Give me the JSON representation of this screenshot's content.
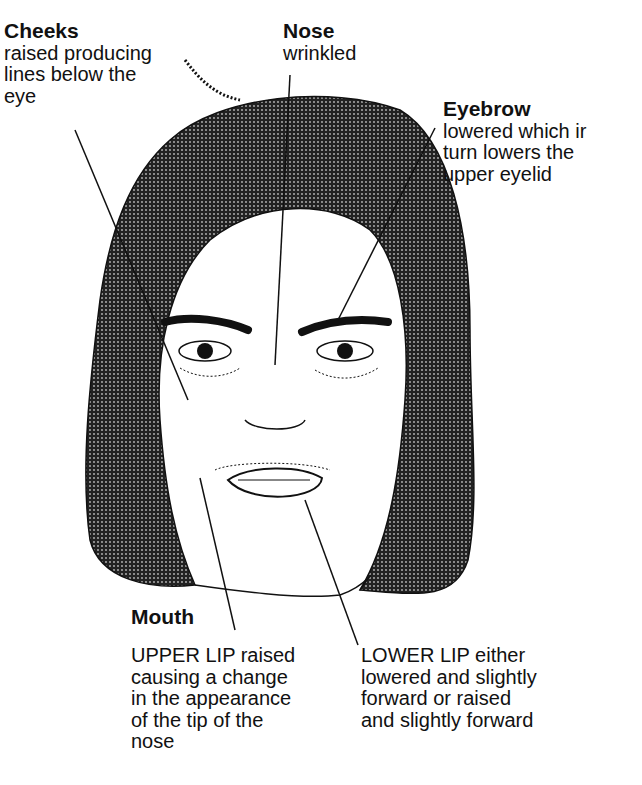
{
  "labels": {
    "cheeks": {
      "title": "Cheeks",
      "lines": [
        "raised producing",
        "lines below the",
        "eye"
      ]
    },
    "nose": {
      "title": "Nose",
      "lines": [
        "wrinkled"
      ]
    },
    "eyebrow": {
      "title": "Eyebrow",
      "lines": [
        "lowered which ir",
        "turn lowers the",
        "upper eyelid"
      ]
    },
    "mouth": {
      "title": "Mouth",
      "upper_lip": [
        "UPPER LIP raised",
        "causing a change",
        "in the appearance",
        "of the tip of the",
        "nose"
      ],
      "lower_lip": [
        "LOWER LIP either",
        "lowered and slightly",
        "forward or raised",
        "and slightly forward"
      ]
    }
  },
  "colors": {
    "hair": "#3a3a3a",
    "line": "#111111",
    "background": "#ffffff"
  }
}
